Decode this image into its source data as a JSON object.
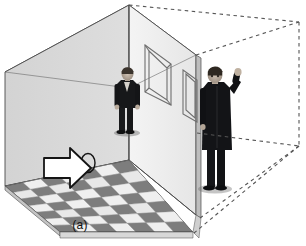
{
  "figure": {
    "caption": "(a)",
    "domain_note": "schematic 3D perspective diagram"
  },
  "colors": {
    "background": "#ffffff",
    "left_wall": "#d9d9d9",
    "back_wall": "#f2f2f2",
    "right_wall_inner": "#eaeaea",
    "ceiling": "#fafafa",
    "floor_dark_tile": "#7d7d7d",
    "floor_light_tile": "#e8e8e8",
    "floor_mid_tile": "#c9c9c9",
    "outline": "#3c3c3c",
    "dashed_line": "#555555",
    "arrow_fill": "#ffffff",
    "arrow_stroke": "#1a1a1a",
    "person_dark": "#17181a",
    "person_skin": "#cfc2b4",
    "ellipse_stroke": "#1a1a1a"
  },
  "room": {
    "name": "room-box",
    "apex_point": "129,5",
    "left_wall_polygon": "5,72 129,5 129,160 5,186",
    "back_wall_polygon": "129,5 196,55 196,215 129,160",
    "ceiling_polygon": "5,72 129,5 196,55 129,88",
    "floor_polygon": "5,186 129,160 193,232 60,232"
  },
  "wireframe": {
    "label": "dashed wireframe extension of room volume",
    "segments": [
      {
        "name": "top-back-edge",
        "from": "129,5",
        "to": "299,22"
      },
      {
        "name": "right-vertical-edge",
        "from": "299,22",
        "to": "299,145"
      },
      {
        "name": "top-right-diagonal",
        "from": "196,55",
        "to": "299,22"
      },
      {
        "name": "mid-horizontal",
        "from": "196,133",
        "to": "299,145"
      },
      {
        "name": "bottom-right-diagonal",
        "from": "299,145",
        "to": "193,232"
      },
      {
        "name": "floor-far-diagonal",
        "from": "196,215",
        "to": "299,145"
      }
    ]
  },
  "wall_frames": [
    {
      "name": "back-wall-picture-frame",
      "outer": "145,45 171,64 171,105 145,92",
      "inner": "149,51 167,64 167,99 149,88"
    },
    {
      "name": "right-wall-picture-frame",
      "outer": "184,71 197,80 197,121 184,113",
      "inner": "187,75 195,82 195,117 187,110"
    }
  ],
  "floor": {
    "name": "checkerboard-floor",
    "rows": 7,
    "cols": 7,
    "pattern": "alternating dark gray and light gray tiles in perspective"
  },
  "people": [
    {
      "name": "person-standing-back",
      "description": "man in dark suit standing against back wall, arms down",
      "position": "left-center",
      "bbox": "114,72 140,133"
    },
    {
      "name": "person-raising-arm",
      "description": "man in dark coat standing at right wall, right arm raised",
      "position": "right",
      "bbox": "196,72 240,190"
    }
  ],
  "annotations": [
    {
      "name": "direction-arrow",
      "type": "block-arrow",
      "direction": "right",
      "fill": "#ffffff",
      "stroke": "#1a1a1a",
      "bbox": "42,148 92,190"
    },
    {
      "name": "target-ellipse-marker",
      "type": "ellipse-outline",
      "center": "88,163",
      "rx": 7,
      "ry": 9
    }
  ]
}
